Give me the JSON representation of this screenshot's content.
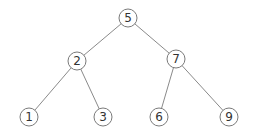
{
  "diagram": {
    "type": "binary-search-tree",
    "nodes": [
      {
        "id": "n5",
        "label": "5",
        "x": 128,
        "y": 18
      },
      {
        "id": "n2",
        "label": "2",
        "x": 77,
        "y": 61
      },
      {
        "id": "n7",
        "label": "7",
        "x": 176,
        "y": 59
      },
      {
        "id": "n1",
        "label": "1",
        "x": 29,
        "y": 117
      },
      {
        "id": "n3",
        "label": "3",
        "x": 103,
        "y": 117
      },
      {
        "id": "n6",
        "label": "6",
        "x": 159,
        "y": 117
      },
      {
        "id": "n9",
        "label": "9",
        "x": 229,
        "y": 117
      }
    ],
    "edges": [
      {
        "from": "n5",
        "to": "n2"
      },
      {
        "from": "n5",
        "to": "n7"
      },
      {
        "from": "n2",
        "to": "n1"
      },
      {
        "from": "n2",
        "to": "n3"
      },
      {
        "from": "n7",
        "to": "n6"
      },
      {
        "from": "n7",
        "to": "n9"
      }
    ]
  }
}
